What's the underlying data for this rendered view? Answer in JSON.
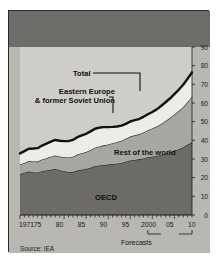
{
  "badge": {
    "number": "3"
  },
  "header": {
    "title": "Revving up",
    "subtitle": "World demand for primary energy",
    "units": "Billion barrels of oil equivalent"
  },
  "footer": {
    "forecasts_label": "Forecasts",
    "source": "Source: IEA"
  },
  "colors": {
    "panel_bg": "#b9b7b2",
    "header_bg": "#6e6c68",
    "plot_bg": "#cfcdc8",
    "oecd": "#6d6b67",
    "rest_of_world": "#a8a6a1",
    "eastern_europe": "#edece8",
    "total_line": "#111111",
    "frame": "#2b2b2b",
    "text_light": "#ffffff",
    "text_dark": "#1a1a1a"
  },
  "chart_data": {
    "type": "area",
    "title": "Revving up",
    "subtitle": "World demand for primary energy",
    "xlabel": "",
    "ylabel": "Billion barrels of oil equivalent",
    "ylim": [
      0,
      90
    ],
    "yticks": [
      0,
      10,
      20,
      30,
      40,
      50,
      60,
      70,
      80,
      90
    ],
    "xlim": [
      1971,
      2010
    ],
    "xticks": [
      1971,
      1975,
      1980,
      1985,
      1990,
      1995,
      2000,
      2005,
      2010
    ],
    "xticklabels": [
      "1971",
      "75",
      "80",
      "85",
      "90",
      "95",
      "2000",
      "05",
      "10"
    ],
    "grid": false,
    "legend": "in-plot labels",
    "stacked": true,
    "forecast_start": 2000,
    "annotations": [
      {
        "text": "Total",
        "series": "Total"
      },
      {
        "text": "Eastern Europe & former Soviet Union",
        "series": "Eastern Europe & former Soviet Union"
      },
      {
        "text": "Rest of the world",
        "series": "Rest of the world"
      },
      {
        "text": "OECD",
        "series": "OECD"
      },
      {
        "text": "Forecasts",
        "note": "spans 2000-2010"
      }
    ],
    "x": [
      1971,
      1972,
      1973,
      1974,
      1975,
      1976,
      1977,
      1978,
      1979,
      1980,
      1981,
      1982,
      1983,
      1984,
      1985,
      1986,
      1987,
      1988,
      1989,
      1990,
      1991,
      1992,
      1993,
      1994,
      1995,
      1996,
      1997,
      1998,
      1999,
      2000,
      2001,
      2002,
      2003,
      2004,
      2005,
      2006,
      2007,
      2008,
      2009,
      2010
    ],
    "series": [
      {
        "name": "OECD",
        "color": "#6d6b67",
        "values": [
          22.0,
          22.6,
          23.3,
          22.9,
          22.6,
          23.4,
          23.8,
          24.3,
          24.7,
          24.0,
          23.4,
          23.0,
          23.1,
          23.9,
          24.3,
          24.7,
          25.3,
          26.1,
          26.5,
          26.8,
          27.0,
          27.3,
          27.5,
          27.9,
          28.5,
          29.2,
          29.5,
          29.8,
          30.3,
          30.9,
          31.2,
          31.6,
          32.2,
          32.9,
          33.6,
          34.4,
          35.2,
          36.2,
          37.6,
          39.0
        ]
      },
      {
        "name": "Rest of the world",
        "color": "#a8a6a1",
        "values": [
          5.0,
          5.3,
          5.6,
          5.8,
          6.0,
          6.3,
          6.6,
          6.9,
          7.2,
          7.4,
          7.6,
          7.8,
          8.1,
          8.5,
          8.8,
          9.1,
          9.5,
          9.9,
          10.2,
          10.5,
          10.8,
          11.1,
          11.5,
          11.9,
          12.3,
          12.8,
          13.2,
          13.4,
          13.9,
          14.5,
          15.1,
          15.8,
          16.6,
          17.5,
          18.4,
          19.4,
          20.5,
          21.7,
          23.0,
          24.4
        ]
      },
      {
        "name": "Eastern Europe & former Soviet Union",
        "color": "#edece8",
        "values": [
          6.0,
          6.3,
          6.6,
          6.9,
          7.2,
          7.5,
          7.8,
          8.1,
          8.3,
          8.4,
          8.6,
          8.8,
          9.0,
          9.3,
          9.5,
          9.7,
          10.0,
          10.2,
          10.1,
          9.8,
          9.3,
          8.8,
          8.4,
          8.1,
          8.0,
          8.1,
          8.1,
          8.2,
          8.4,
          8.6,
          8.9,
          9.2,
          9.6,
          10.0,
          10.4,
          10.9,
          11.4,
          11.9,
          12.4,
          13.0
        ]
      }
    ],
    "total": {
      "name": "Total",
      "color": "#111111",
      "values": [
        33.0,
        34.2,
        35.5,
        35.6,
        35.8,
        37.2,
        38.2,
        39.3,
        40.2,
        39.8,
        39.6,
        39.6,
        40.2,
        41.7,
        42.6,
        43.5,
        44.8,
        46.2,
        46.8,
        47.1,
        47.1,
        47.2,
        47.4,
        47.9,
        48.8,
        50.1,
        50.8,
        51.4,
        52.6,
        54.0,
        55.2,
        56.6,
        58.4,
        60.4,
        62.4,
        64.7,
        67.1,
        69.8,
        73.0,
        76.4
      ]
    }
  }
}
